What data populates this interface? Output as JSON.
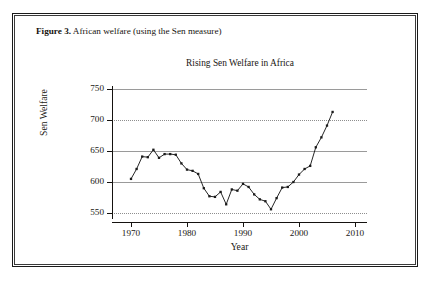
{
  "figure": {
    "caption_label": "Figure 3.",
    "caption_text": "African welfare (using the Sen measure)"
  },
  "chart_data": {
    "type": "line",
    "title": "Rising Sen Welfare in Africa",
    "xlabel": "Year",
    "ylabel": "Sen Welfare",
    "xlim": [
      1968,
      2012
    ],
    "ylim": [
      538,
      762
    ],
    "xticks": [
      1970,
      1980,
      1990,
      2000,
      2010
    ],
    "yticks": [
      550,
      600,
      650,
      700,
      750
    ],
    "grid": "horizontal",
    "gridline_styles": {
      "750": "solid",
      "700": "dotted",
      "650": "solid",
      "600": "solid",
      "550": "dotted"
    },
    "legend": "none",
    "marker": "filled-square",
    "line_color": "#1a1a1a",
    "series": [
      {
        "name": "Sen Welfare",
        "x": [
          1970,
          1971,
          1972,
          1973,
          1974,
          1975,
          1976,
          1977,
          1978,
          1979,
          1980,
          1981,
          1982,
          1983,
          1984,
          1985,
          1986,
          1987,
          1988,
          1989,
          1990,
          1991,
          1992,
          1993,
          1994,
          1995,
          1996,
          1997,
          1998,
          1999,
          2000,
          2001,
          2002,
          2003,
          2004,
          2005,
          2006
        ],
        "values": [
          605,
          621,
          641,
          640,
          652,
          639,
          645,
          645,
          644,
          630,
          620,
          618,
          613,
          590,
          577,
          576,
          584,
          564,
          588,
          586,
          597,
          592,
          580,
          572,
          569,
          556,
          574,
          591,
          592,
          600,
          612,
          621,
          626,
          656,
          672,
          691,
          713
        ]
      }
    ],
    "annotations": {
      "maximum": {
        "year": 2006,
        "value": 713
      },
      "minimum": {
        "year": 1995,
        "value": 556
      },
      "early_peak": {
        "year": 1974,
        "value": 652
      }
    }
  }
}
